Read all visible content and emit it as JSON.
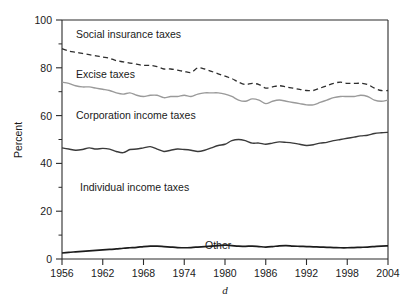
{
  "chart_data": {
    "type": "line",
    "title": "",
    "xlabel": "d",
    "ylabel": "Percent",
    "xlim": [
      1956,
      2004
    ],
    "ylim": [
      0,
      100
    ],
    "grid": false,
    "legend_position": "inline-annotations",
    "x_ticks": [
      1956,
      1962,
      1968,
      1974,
      1980,
      1986,
      1992,
      1998,
      2004
    ],
    "y_ticks": [
      0,
      20,
      40,
      60,
      80,
      100
    ],
    "y_minor_ticks": [
      10,
      30,
      50,
      70,
      90
    ],
    "annotations": [
      {
        "text": "Social insurance taxes",
        "x": 1960,
        "y": 94
      },
      {
        "text": "Excise taxes",
        "x": 1960,
        "y": 78
      },
      {
        "text": "Corporation income taxes",
        "x": 1960,
        "y": 61
      },
      {
        "text": "Individual income taxes",
        "x": 1961,
        "y": 32
      },
      {
        "text": "Other",
        "x": 1975,
        "y": 4
      }
    ],
    "x": [
      1956,
      1957,
      1958,
      1959,
      1960,
      1961,
      1962,
      1963,
      1964,
      1965,
      1966,
      1967,
      1968,
      1969,
      1970,
      1971,
      1972,
      1973,
      1974,
      1975,
      1976,
      1977,
      1978,
      1979,
      1980,
      1981,
      1982,
      1983,
      1984,
      1985,
      1986,
      1987,
      1988,
      1989,
      1990,
      1991,
      1992,
      1993,
      1994,
      1995,
      1996,
      1997,
      1998,
      1999,
      2000,
      2001,
      2002,
      2003,
      2004
    ],
    "series": [
      {
        "name": "Other cumulative (top of Other band)",
        "style": "solid-black-thick",
        "values": [
          2.5,
          2.8,
          3.0,
          3.2,
          3.4,
          3.6,
          3.8,
          4.0,
          4.2,
          4.5,
          4.7,
          4.9,
          5.2,
          5.4,
          5.4,
          5.2,
          5.0,
          4.8,
          4.7,
          4.8,
          5.0,
          5.2,
          5.4,
          5.6,
          5.8,
          5.6,
          5.4,
          5.3,
          5.4,
          5.2,
          5.0,
          5.2,
          5.5,
          5.6,
          5.4,
          5.3,
          5.2,
          5.1,
          5.0,
          4.9,
          4.8,
          4.7,
          4.7,
          4.8,
          4.9,
          5.0,
          5.2,
          5.4,
          5.5
        ]
      },
      {
        "name": "Individual income taxes cumulative (top of Individual band)",
        "style": "solid-dark",
        "values": [
          46.5,
          46.0,
          45.5,
          45.8,
          46.5,
          46.0,
          46.3,
          46.0,
          45.0,
          44.5,
          45.8,
          46.0,
          46.5,
          47.0,
          46.0,
          45.0,
          45.5,
          46.0,
          45.8,
          45.5,
          45.0,
          45.5,
          46.5,
          47.5,
          48.0,
          49.5,
          50.0,
          49.5,
          48.5,
          48.5,
          48.0,
          48.5,
          49.0,
          48.8,
          48.5,
          48.0,
          47.5,
          47.8,
          48.5,
          48.8,
          49.5,
          50.0,
          50.5,
          51.0,
          51.5,
          51.8,
          52.5,
          52.8,
          53.0
        ]
      },
      {
        "name": "Corporation income taxes cumulative (top of Corporation band)",
        "style": "solid-gray",
        "values": [
          74.0,
          73.5,
          72.5,
          72.0,
          72.0,
          71.5,
          71.0,
          70.5,
          69.5,
          69.0,
          69.5,
          68.5,
          68.0,
          68.5,
          68.5,
          67.5,
          68.0,
          68.0,
          68.5,
          68.0,
          69.0,
          69.5,
          69.5,
          69.5,
          69.0,
          68.0,
          66.5,
          66.0,
          67.0,
          66.5,
          65.0,
          66.0,
          66.5,
          66.0,
          65.5,
          65.0,
          64.5,
          64.5,
          65.5,
          66.5,
          67.5,
          68.0,
          68.0,
          68.0,
          68.5,
          68.0,
          66.5,
          66.0,
          66.5
        ]
      },
      {
        "name": "Excise taxes cumulative (top of Excise band)",
        "style": "dashed-dark",
        "values": [
          88.0,
          87.0,
          86.5,
          86.0,
          85.5,
          85.0,
          84.5,
          84.0,
          83.0,
          82.5,
          82.0,
          81.5,
          81.0,
          81.0,
          80.5,
          79.5,
          79.5,
          79.0,
          78.5,
          78.0,
          80.0,
          79.5,
          78.5,
          77.5,
          76.5,
          75.5,
          74.0,
          73.0,
          73.5,
          73.0,
          71.5,
          72.0,
          72.5,
          72.0,
          71.5,
          71.0,
          70.5,
          70.5,
          71.5,
          72.5,
          73.5,
          74.0,
          73.5,
          73.5,
          73.5,
          73.0,
          71.5,
          70.5,
          70.5
        ]
      }
    ]
  },
  "axes": {
    "y_title": "Percent",
    "x_title": "d",
    "x_tick_labels": [
      "1956",
      "1962",
      "1968",
      "1974",
      "1980",
      "1986",
      "1992",
      "1998",
      "2004"
    ],
    "y_tick_labels": [
      "0",
      "20",
      "40",
      "60",
      "80",
      "100"
    ]
  },
  "colors": {
    "axis": "#2b2b2b",
    "dashed_line": "#2e2e2e",
    "gray_line": "#9a9a9a",
    "dark_line": "#3a3a3a",
    "other_line": "#1c1c1c",
    "background": "#ffffff"
  }
}
